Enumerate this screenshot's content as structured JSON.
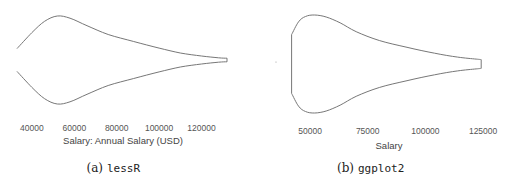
{
  "chart_data": [
    {
      "type": "violin",
      "panel": "a",
      "caption_prefix": "(a)",
      "caption_name": "lessR",
      "xlabel": "Salary: Annual Salary (USD)",
      "ylabel": "",
      "xlim": [
        33000,
        132000
      ],
      "x_ticks": [
        "40000",
        "60000",
        "80000",
        "100000",
        "120000"
      ],
      "x_tick_values": [
        40000,
        60000,
        80000,
        100000,
        120000
      ],
      "density_profile": {
        "x": [
          33000,
          40000,
          46000,
          52000,
          58000,
          66000,
          76000,
          88000,
          100000,
          110000,
          120000,
          128000,
          132000
        ],
        "half_width": [
          0.26,
          0.62,
          0.88,
          1.0,
          0.95,
          0.78,
          0.58,
          0.42,
          0.27,
          0.16,
          0.09,
          0.05,
          0.04
        ]
      },
      "grid": false
    },
    {
      "type": "violin",
      "panel": "b",
      "caption_prefix": "(b)",
      "caption_name": "ggplot2",
      "xlabel": "Salary",
      "ylabel": "",
      "xlim": [
        40000,
        128000
      ],
      "x_ticks": [
        "50000",
        "75000",
        "100000",
        "125000"
      ],
      "x_tick_values": [
        50000,
        75000,
        100000,
        125000
      ],
      "density_profile": {
        "x": [
          42000,
          45000,
          48000,
          52000,
          57000,
          63000,
          70000,
          80000,
          92000,
          104000,
          114000,
          122000,
          124200
        ],
        "half_width": [
          0.6,
          0.86,
          0.97,
          1.0,
          0.96,
          0.84,
          0.66,
          0.48,
          0.34,
          0.22,
          0.14,
          0.1,
          0.09
        ]
      },
      "grid": false
    }
  ]
}
